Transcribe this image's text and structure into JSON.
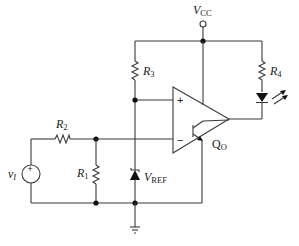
{
  "diagram": {
    "type": "circuit-schematic",
    "colors": {
      "wire": "#3a3a3a",
      "junction": "#111111",
      "background": "#ffffff"
    },
    "labels": {
      "vcc": {
        "main": "V",
        "sub": "CC"
      },
      "r1": {
        "main": "R",
        "sub": "1"
      },
      "r2": {
        "main": "R",
        "sub": "2"
      },
      "r3": {
        "main": "R",
        "sub": "3"
      },
      "r4": {
        "main": "R",
        "sub": "4"
      },
      "vref": {
        "main": "V",
        "sub": "REF"
      },
      "vi": {
        "main": "v",
        "sub": "I"
      },
      "qo": {
        "main": "Q",
        "sub": "O"
      },
      "opamp_plus": "+",
      "opamp_minus": "−",
      "source_plus": "+"
    },
    "components": [
      {
        "id": "VCC",
        "kind": "supply-terminal"
      },
      {
        "id": "R1",
        "kind": "resistor"
      },
      {
        "id": "R2",
        "kind": "resistor"
      },
      {
        "id": "R3",
        "kind": "resistor"
      },
      {
        "id": "R4",
        "kind": "resistor"
      },
      {
        "id": "LED",
        "kind": "light-emitting-diode"
      },
      {
        "id": "VREF",
        "kind": "zener-diode"
      },
      {
        "id": "vI",
        "kind": "voltage-source"
      },
      {
        "id": "U1",
        "kind": "comparator"
      },
      {
        "id": "QO",
        "kind": "npn-output-transistor"
      },
      {
        "id": "GND",
        "kind": "ground"
      }
    ]
  }
}
